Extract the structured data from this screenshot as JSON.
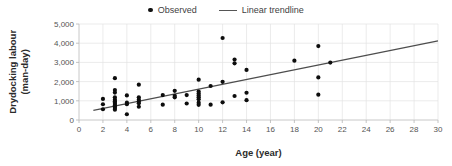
{
  "chart_data": {
    "type": "scatter",
    "title": "",
    "xlabel": "Age (year)",
    "ylabel": "Drydocking labour\n(man-day)",
    "ylabel_line1": "Drydocking labour",
    "ylabel_line2": "(man-day)",
    "xlim": [
      0,
      30
    ],
    "ylim": [
      0,
      5000
    ],
    "xticks": [
      0,
      2,
      4,
      6,
      8,
      10,
      12,
      14,
      16,
      18,
      20,
      22,
      24,
      26,
      28,
      30
    ],
    "xtick_labels": [
      "0",
      "2",
      "4",
      "6",
      "8",
      "10",
      "12",
      "14",
      "16",
      "18",
      "20",
      "22",
      "24",
      "26",
      "28",
      "30"
    ],
    "yticks": [
      0,
      1000,
      2000,
      3000,
      4000,
      5000
    ],
    "ytick_labels": [
      "0",
      "1,000",
      "2,000",
      "3,000",
      "4,000",
      "5,000"
    ],
    "grid": true,
    "grid_axis": "both",
    "legend_position": "top-center",
    "legend": [
      {
        "label": "Observed",
        "marker": "dot",
        "color": "#0d0d0d"
      },
      {
        "label": "Linear trendline",
        "marker": "line",
        "color": "#555555"
      }
    ],
    "series": [
      {
        "name": "Observed",
        "marker": "dot",
        "color": "#0d0d0d",
        "points": [
          [
            2,
            1100
          ],
          [
            2,
            820
          ],
          [
            2,
            560
          ],
          [
            3,
            2180
          ],
          [
            3,
            1560
          ],
          [
            3,
            1430
          ],
          [
            3,
            1180
          ],
          [
            3,
            1060
          ],
          [
            3,
            980
          ],
          [
            3,
            900
          ],
          [
            3,
            830
          ],
          [
            3,
            760
          ],
          [
            3,
            690
          ],
          [
            3,
            620
          ],
          [
            3,
            540
          ],
          [
            4,
            1280
          ],
          [
            4,
            900
          ],
          [
            4,
            820
          ],
          [
            4,
            300
          ],
          [
            5,
            1840
          ],
          [
            5,
            1180
          ],
          [
            5,
            1060
          ],
          [
            5,
            960
          ],
          [
            5,
            870
          ],
          [
            5,
            690
          ],
          [
            7,
            1300
          ],
          [
            7,
            800
          ],
          [
            8,
            1520
          ],
          [
            8,
            1260
          ],
          [
            8,
            1180
          ],
          [
            9,
            1300
          ],
          [
            9,
            860
          ],
          [
            10,
            2100
          ],
          [
            10,
            1480
          ],
          [
            10,
            1380
          ],
          [
            10,
            1280
          ],
          [
            10,
            1180
          ],
          [
            10,
            1080
          ],
          [
            10,
            900
          ],
          [
            10,
            790
          ],
          [
            11,
            1770
          ],
          [
            11,
            800
          ],
          [
            12,
            4270
          ],
          [
            12,
            1990
          ],
          [
            12,
            920
          ],
          [
            13,
            3150
          ],
          [
            13,
            2950
          ],
          [
            13,
            1250
          ],
          [
            14,
            2610
          ],
          [
            14,
            1420
          ],
          [
            14,
            1030
          ],
          [
            18,
            3090
          ],
          [
            20,
            3850
          ],
          [
            20,
            2220
          ],
          [
            20,
            1320
          ],
          [
            21,
            2990
          ]
        ]
      }
    ],
    "trendline": {
      "name": "Linear trendline",
      "color": "#4d4d4d",
      "x_start": 1.2,
      "y_start": 500,
      "x_end": 30,
      "y_end": 4120
    }
  }
}
